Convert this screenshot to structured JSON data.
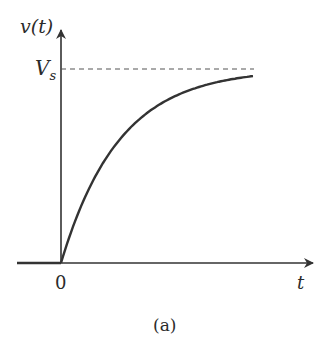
{
  "figure": {
    "y_axis_label": "v(t)",
    "x_axis_label": "t",
    "level_label_main": "V",
    "level_label_sub": "s",
    "origin_label": "0",
    "caption": "(a)"
  },
  "colors": {
    "axis": "#333333",
    "curve": "#333333",
    "dashed": "#555555",
    "background": "#ffffff"
  },
  "chart_data": {
    "type": "line",
    "title": "",
    "xlabel": "t",
    "ylabel": "v(t)",
    "function": "v(t) = Vs (1 - e^(-t/tau)), v(t)=0 for t<0",
    "asymptote": {
      "label": "Vs",
      "style": "dashed"
    },
    "x_ticks": [
      "0"
    ],
    "y_ticks": [
      "Vs"
    ],
    "caption": "(a)",
    "series": [
      {
        "name": "v(t)",
        "x_tau_units": [
          -1.0,
          0,
          0.5,
          1,
          1.5,
          2,
          2.5,
          3,
          3.3
        ],
        "y_fraction_of_Vs": [
          0,
          0,
          0.39,
          0.63,
          0.78,
          0.86,
          0.92,
          0.95,
          0.96
        ]
      }
    ],
    "grid": false,
    "legend": "none"
  }
}
